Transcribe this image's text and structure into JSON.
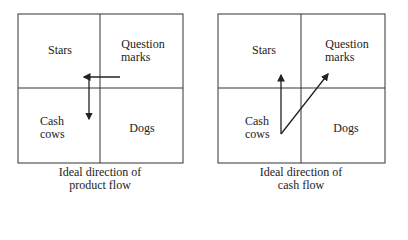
{
  "diagrams": [
    {
      "quadrants": {
        "top_left": "Stars",
        "top_right_line1": "Question",
        "top_right_line2": "marks",
        "bottom_left_line1": "Cash",
        "bottom_left_line2": "cows",
        "bottom_right": "Dogs"
      },
      "caption_line1": "Ideal direction of",
      "caption_line2": "product flow"
    },
    {
      "quadrants": {
        "top_left": "Stars",
        "top_right_line1": "Question",
        "top_right_line2": "marks",
        "bottom_left_line1": "Cash",
        "bottom_left_line2": "cows",
        "bottom_right": "Dogs"
      },
      "caption_line1": "Ideal direction of",
      "caption_line2": "cash flow"
    }
  ],
  "colors": {
    "line": "#333333"
  }
}
